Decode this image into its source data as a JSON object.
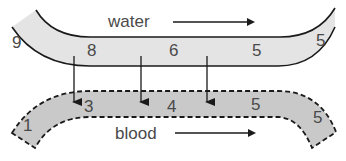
{
  "diagram": {
    "type": "countercurrent-exchange",
    "colors": {
      "water_fill": "#e4e4e4",
      "blood_fill": "#c9c9c9",
      "stroke": "#1a1a1a",
      "text": "#4a4a4a"
    },
    "water": {
      "label": "water",
      "direction": "right",
      "values": [
        "9",
        "8",
        "6",
        "5",
        "5"
      ]
    },
    "blood": {
      "label": "blood",
      "direction": "right",
      "values": [
        "1",
        "3",
        "4",
        "5",
        "5"
      ]
    },
    "transfer_arrows": 3
  }
}
